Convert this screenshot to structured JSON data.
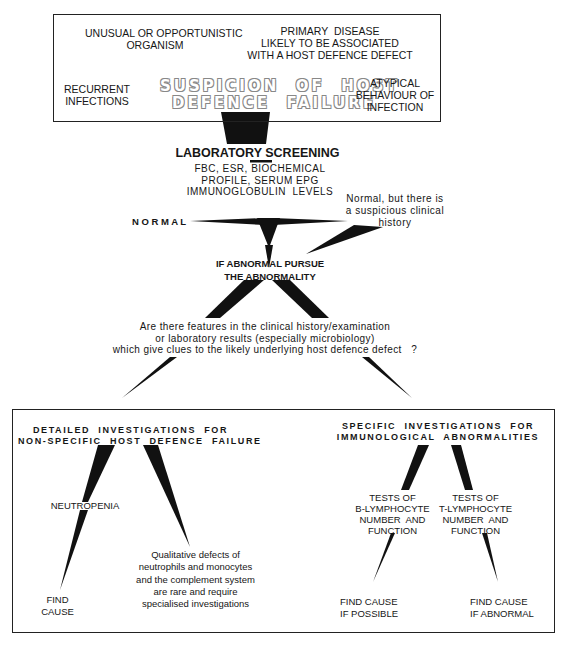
{
  "diagram": {
    "type": "flowchart",
    "top_box": {
      "title_line1": "SUSPICION  OF  HOST",
      "title_line2": "DEFENCE  FAILURE",
      "unusual_organism": "UNUSUAL OR OPPORTUNISTIC\nORGANISM",
      "primary_disease": "PRIMARY  DISEASE\nLIKELY TO BE ASSOCIATED\nWITH A HOST DEFENCE DEFECT",
      "recurrent_infections": "RECURRENT\nINFECTIONS",
      "atypical_behaviour": "ATYPICAL\nBEHAVIOUR OF\nINFECTION"
    },
    "lab_screening": {
      "title": "LABORATORY SCREENING",
      "details": "FBC, ESR, BIOCHEMICAL\nPROFILE, SERUM EPG\nIMMUNOGLOBULIN  LEVELS"
    },
    "normal_label": "N O R M A L",
    "normal_suspicious": "Normal, but there is\na suspicious clinical\nhistory",
    "if_abnormal": "IF ABNORMAL PURSUE\nTHE ABNORMALITY",
    "question": "Are there features in the clinical history/examination\nor laboratory results (especially microbiology)\nwhich give clues to the likely underlying host defence defect   ?",
    "bottom_box": {
      "left_title": "DETAILED  INVESTIGATIONS  FOR\nNON-SPECIFIC  HOST  DEFENCE  FAILURE",
      "neutropenia": "NEUTROPENIA",
      "find_cause": "FIND\nCAUSE",
      "qualitative": "Qualitative defects of\nneutrophils and monocytes\nand the complement system\nare rare and require\nspecialised investigations",
      "right_title": "SPECIFIC  INVESTIGATIONS  FOR\nIMMUNOLOGICAL  ABNORMALITIES",
      "b_lymph": "TESTS OF\nB-LYMPHOCYTE\nNUMBER  AND\nFUNCTION",
      "t_lymph": "TESTS OF\nT-LYMPHOCYTE\nNUMBER  AND\nFUNCTION",
      "find_cause_possible": "FIND CAUSE\nIF POSSIBLE",
      "find_cause_abnormal": "FIND CAUSE\nIF ABNORMAL"
    }
  }
}
